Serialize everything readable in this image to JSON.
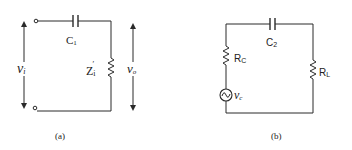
{
  "diagram": {
    "type": "circuit-schematic",
    "colors": {
      "ink": "#2a2a2a",
      "background": "#ffffff"
    },
    "subfigures": [
      {
        "id": "a",
        "caption": "(a)",
        "components": [
          {
            "kind": "terminal",
            "label": ""
          },
          {
            "kind": "capacitor",
            "label": "C",
            "subscript": "1"
          },
          {
            "kind": "impedance-resistor",
            "label": "Z",
            "subscript": "i",
            "prime": "′"
          },
          {
            "kind": "voltage-arrow",
            "label": "v",
            "subscript": "i"
          },
          {
            "kind": "voltage-arrow",
            "label": "v",
            "subscript": "o"
          }
        ]
      },
      {
        "id": "b",
        "caption": "(b)",
        "components": [
          {
            "kind": "capacitor",
            "label": "C",
            "subscript": "2"
          },
          {
            "kind": "resistor",
            "label": "R",
            "subscript": "C"
          },
          {
            "kind": "ac-source",
            "label": "v",
            "subscript": "c"
          },
          {
            "kind": "resistor",
            "label": "R",
            "subscript": "L"
          }
        ]
      }
    ]
  }
}
